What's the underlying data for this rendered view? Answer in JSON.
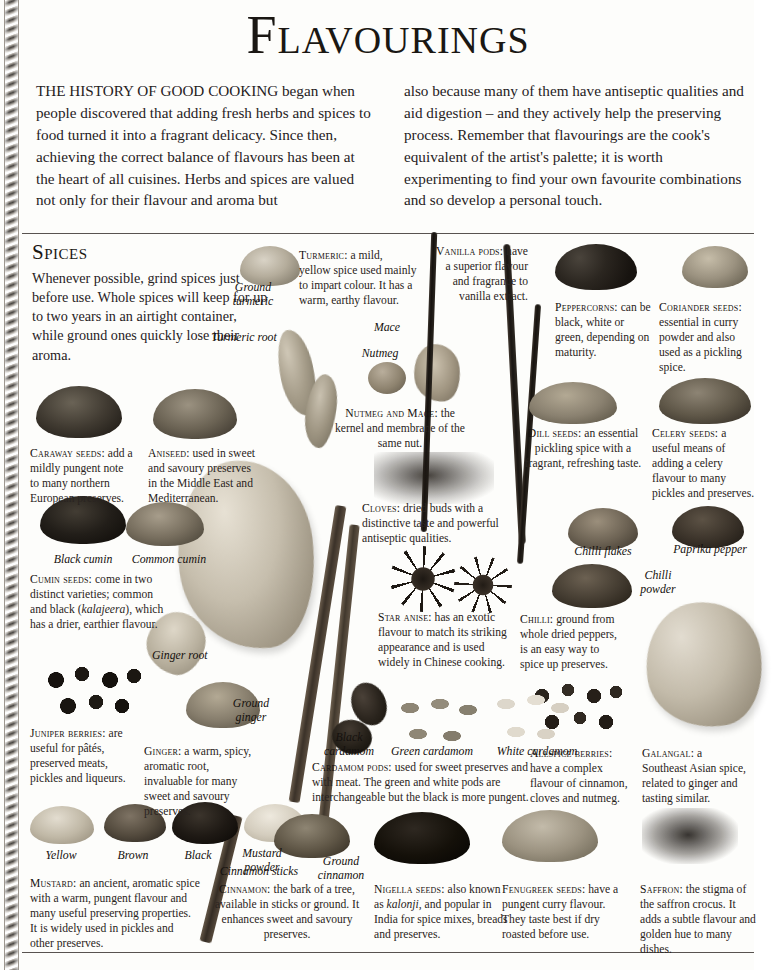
{
  "page": {
    "title": "Flavourings",
    "background_color": "#fdfdfb",
    "text_color": "#231f1c",
    "rule_color": "#585350"
  },
  "intro": {
    "column_left": "THE HISTORY OF GOOD COOKING began when people discovered that adding fresh herbs and spices to food turned it into a fragrant delicacy. Since then, achieving the correct balance of flavours has been at the heart of all cuisines. Herbs and spices are valued not only for their flavour and aroma but",
    "column_right": "also because many of them have antiseptic qualities and aid digestion – and they actively help the preserving process. Remember that flavourings are the cook's equivalent of the artist's palette; it is worth experimenting to find your own favourite combinations and so develop a personal touch."
  },
  "spices_section": {
    "heading": "Spices",
    "intro": "Whenever possible, grind spices just before use. Whole spices will keep for up to two years in an airtight container, while ground ones quickly lose their aroma."
  },
  "specimen_labels": {
    "ground_turmeric": "Ground turmeric",
    "turmeric_root": "Turmeric root",
    "mace": "Mace",
    "nutmeg": "Nutmeg",
    "black_cumin": "Black cumin",
    "common_cumin": "Common cumin",
    "ginger_root": "Ginger root",
    "ground_ginger": "Ground ginger",
    "black_cardamom": "Black cardamom",
    "green_cardamom": "Green cardamom",
    "white_cardamom": "White cardamom",
    "chilli_flakes": "Chilli flakes",
    "paprika_pepper": "Paprika pepper",
    "chilli_powder": "Chilli powder",
    "yellow": "Yellow",
    "brown": "Brown",
    "black": "Black",
    "mustard_powder": "Mustard powder",
    "cinnamon_sticks": "Cinnamon sticks",
    "ground_cinnamon": "Ground cinnamon"
  },
  "captions": {
    "caraway": {
      "label": "Caraway seeds:",
      "text": " add a mildly pungent note to many northern European preserves."
    },
    "aniseed": {
      "label": "Aniseed:",
      "text": " used in sweet and savoury preserves in the Middle East and Mediterranean."
    },
    "turmeric": {
      "label": "Turmeric:",
      "text": " a mild, yellow spice used mainly to impart colour. It has a warm, earthy flavour."
    },
    "vanilla": {
      "label": "Vanilla pods:",
      "text": " have a superior flavour and fragrance to vanilla extract."
    },
    "peppercorns": {
      "label": "Peppercorns:",
      "text": " can be black, white or green, depending on maturity."
    },
    "coriander": {
      "label": "Coriander seeds:",
      "text": " essential in curry powder and also used as a pickling spice."
    },
    "nutmeg_mace": {
      "label": "Nutmeg and Mace:",
      "text": " the kernel and membrane of the same nut."
    },
    "dill": {
      "label": "Dill seeds:",
      "text": " an essential pickling spice with a fragrant, refreshing taste."
    },
    "celery": {
      "label": "Celery seeds:",
      "text": " a useful means of adding a celery flavour to many pickles and preserves."
    },
    "cloves": {
      "label": "Cloves:",
      "text": " dried buds with a distinctive taste and powerful antiseptic qualities."
    },
    "cumin": {
      "label": "Cumin seeds:",
      "text": " come in two distinct varieties; common and black (",
      "italic": "kalajeera",
      "text2": "), which has a drier, earthier flavour."
    },
    "star_anise": {
      "label": "Star anise:",
      "text": " has an exotic flavour to match its striking appearance and is used widely in Chinese cooking."
    },
    "chilli": {
      "label": "Chilli:",
      "text": " ground from whole dried peppers, is an easy way to spice up preserves."
    },
    "juniper": {
      "label": "Juniper berries:",
      "text": " are useful for pâtés, preserved meats, pickles and liqueurs."
    },
    "ginger": {
      "label": "Ginger:",
      "text": " a warm, spicy, aromatic root, invaluable for many sweet and savoury preserves."
    },
    "cardamom": {
      "label": "Cardamom pods:",
      "text": " used for sweet preserves and with meat. The green and white pods are interchangeable but the black is more pungent."
    },
    "allspice": {
      "label": "Allspice berries:",
      "text": " have a complex flavour of cinnamon, cloves and nutmeg."
    },
    "galangal": {
      "label": "Galangal:",
      "text": " a Southeast Asian spice, related to ginger and tasting similar."
    },
    "mustard": {
      "label": "Mustard:",
      "text": " an ancient, aromatic spice with a warm, pungent flavour and many useful preserving properties. It is widely used in pickles and other preserves."
    },
    "cinnamon": {
      "label": "Cinnamon:",
      "text": " the bark of a tree, available in sticks or ground. It enhances sweet and savoury preserves."
    },
    "nigella": {
      "label": "Nigella seeds:",
      "text": " also known as ",
      "italic": "kalonji",
      "text2": ", and popular in India for spice mixes, breads and preserves."
    },
    "fenugreek": {
      "label": "Fenugreek seeds:",
      "text": " have a pungent curry flavour. They taste best if dry roasted before use."
    },
    "saffron": {
      "label": "Saffron:",
      "text": " the stigma of the saffron crocus. It adds a subtle flavour and golden hue to many dishes."
    }
  }
}
